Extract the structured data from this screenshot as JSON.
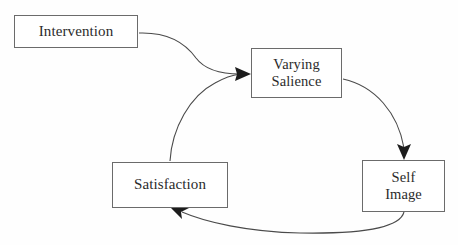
{
  "diagram": {
    "background_color": "#fefefe",
    "stroke_color": "#4a4a4a",
    "box_border_color": "#6b6b6b",
    "text_color": "#2b2b2b",
    "nodes": [
      {
        "id": "intervention",
        "label": "Intervention"
      },
      {
        "id": "varying-salience",
        "label": "Varying\nSalience"
      },
      {
        "id": "self-image",
        "label": "Self\nImage"
      },
      {
        "id": "satisfaction",
        "label": "Satisfaction"
      }
    ],
    "edges": [
      {
        "id": "intervention-to-varying-salience",
        "from": "intervention",
        "to": "varying-salience",
        "arrow": "end",
        "shape": "s-curve"
      },
      {
        "id": "varying-salience-to-self-image",
        "from": "varying-salience",
        "to": "self-image",
        "arrow": "end",
        "shape": "arc-right"
      },
      {
        "id": "self-image-to-satisfaction",
        "from": "self-image",
        "to": "satisfaction",
        "arrow": "end",
        "shape": "arc-bottom"
      },
      {
        "id": "satisfaction-to-varying-salience",
        "from": "satisfaction",
        "to": "varying-salience",
        "arrow": "end",
        "shape": "arc-left"
      }
    ]
  }
}
